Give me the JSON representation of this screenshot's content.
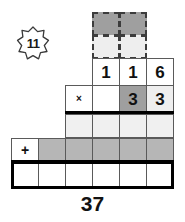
{
  "puzzle": {
    "badge": {
      "value": "11",
      "icon": "eight-point-star-icon"
    },
    "total": "37",
    "operators": {
      "multiply": "×",
      "plus": "+"
    },
    "colors": {
      "dark_fill": "#9f9f9f",
      "mid_fill": "#b6b6b6",
      "light_fill": "#f0f0f0",
      "pale_fill": "#eeeeee",
      "white_fill": "#ffffff",
      "line": "#5a5a5a",
      "heavy_line": "#000000",
      "text": "#111111"
    },
    "rows": [
      {
        "name": "carry-row-top",
        "style": "dashed",
        "cells": [
          {
            "col": 3,
            "value": "",
            "fill": "dark"
          },
          {
            "col": 4,
            "value": "",
            "fill": "dark"
          }
        ]
      },
      {
        "name": "carry-row-bottom",
        "style": "dashed",
        "cells": [
          {
            "col": 3,
            "value": "",
            "fill": "pale"
          },
          {
            "col": 4,
            "value": "",
            "fill": "pale"
          }
        ]
      },
      {
        "name": "multiplicand-row",
        "style": "solid",
        "cells": [
          {
            "col": 3,
            "value": "1",
            "fill": "white"
          },
          {
            "col": 4,
            "value": "1",
            "fill": "white"
          },
          {
            "col": 5,
            "value": "6",
            "fill": "white"
          }
        ]
      },
      {
        "name": "multiplier-row",
        "style": "solid",
        "cells": [
          {
            "col": 2,
            "value": "×",
            "fill": "white"
          },
          {
            "col": 3,
            "value": "",
            "fill": "white"
          },
          {
            "col": 4,
            "value": "3",
            "fill": "dark"
          },
          {
            "col": 5,
            "value": "3",
            "fill": "pale"
          }
        ]
      },
      {
        "name": "partial-product-row-1",
        "style": "solid",
        "cells": [
          {
            "col": 2,
            "value": "",
            "fill": "light"
          },
          {
            "col": 3,
            "value": "",
            "fill": "light"
          },
          {
            "col": 4,
            "value": "",
            "fill": "light"
          },
          {
            "col": 5,
            "value": "",
            "fill": "light"
          }
        ]
      },
      {
        "name": "partial-product-row-2",
        "style": "solid",
        "cells": [
          {
            "col": 0,
            "value": "+",
            "fill": "white"
          },
          {
            "col": 1,
            "value": "",
            "fill": "mid"
          },
          {
            "col": 2,
            "value": "",
            "fill": "mid"
          },
          {
            "col": 3,
            "value": "",
            "fill": "mid"
          },
          {
            "col": 4,
            "value": "",
            "fill": "mid"
          },
          {
            "col": 5,
            "value": "",
            "fill": "mid"
          }
        ]
      },
      {
        "name": "sum-row",
        "style": "solid",
        "cells": [
          {
            "col": 0,
            "value": "",
            "fill": "white"
          },
          {
            "col": 1,
            "value": "",
            "fill": "white"
          },
          {
            "col": 2,
            "value": "",
            "fill": "white"
          },
          {
            "col": 3,
            "value": "",
            "fill": "white"
          },
          {
            "col": 4,
            "value": "",
            "fill": "white"
          },
          {
            "col": 5,
            "value": "",
            "fill": "white"
          }
        ]
      }
    ]
  }
}
